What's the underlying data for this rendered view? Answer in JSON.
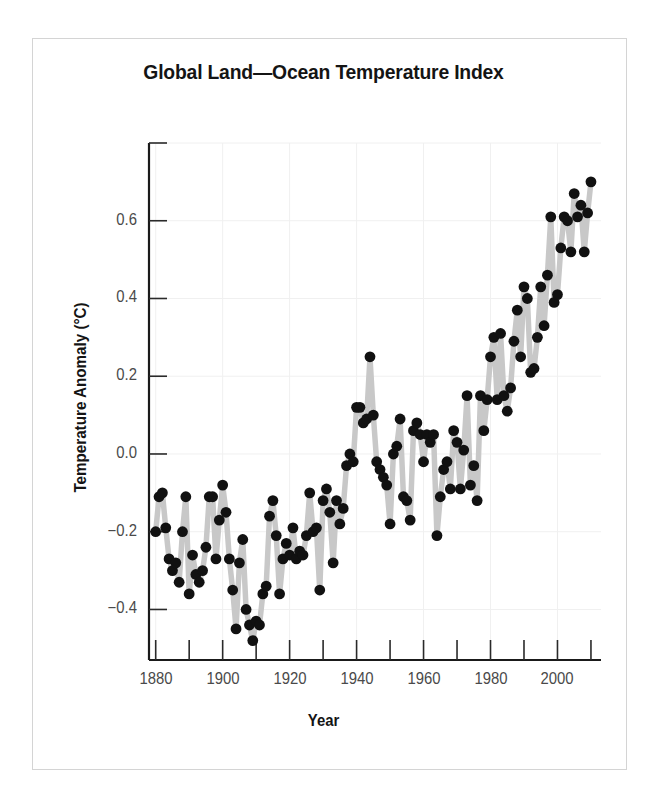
{
  "chart_data": {
    "type": "line",
    "title": "Global Land—Ocean Temperature Index",
    "xlabel": "Year",
    "ylabel": "Temperature Anomaly (°C)",
    "xlim": [
      1878,
      2013
    ],
    "ylim": [
      -0.53,
      0.8
    ],
    "grid": true,
    "legend": "none",
    "marker": "filled-circle",
    "marker_color": "#111111",
    "line_color": "#c8c8c8",
    "x_major_ticks": [
      1880,
      1900,
      1920,
      1940,
      1960,
      1980,
      2000
    ],
    "x_major_tick_labels": [
      "1880",
      "1900",
      "1920",
      "1940",
      "1960",
      "1980",
      "2000"
    ],
    "x_minor_ticks": [
      1890,
      1910,
      1930,
      1950,
      1970,
      1990,
      2010
    ],
    "y_major_ticks": [
      -0.4,
      -0.2,
      0.0,
      0.2,
      0.4,
      0.6,
      0.8
    ],
    "y_major_tick_labels": [
      "-0.4",
      "-0.2",
      "0.0",
      "0.2",
      "0.4",
      "0.6",
      ""
    ],
    "x": [
      1880,
      1881,
      1882,
      1883,
      1884,
      1885,
      1886,
      1887,
      1888,
      1889,
      1890,
      1891,
      1892,
      1893,
      1894,
      1895,
      1896,
      1897,
      1898,
      1899,
      1900,
      1901,
      1902,
      1903,
      1904,
      1905,
      1906,
      1907,
      1908,
      1909,
      1910,
      1911,
      1912,
      1913,
      1914,
      1915,
      1916,
      1917,
      1918,
      1919,
      1920,
      1921,
      1922,
      1923,
      1924,
      1925,
      1926,
      1927,
      1928,
      1929,
      1930,
      1931,
      1932,
      1933,
      1934,
      1935,
      1936,
      1937,
      1938,
      1939,
      1940,
      1941,
      1942,
      1943,
      1944,
      1945,
      1946,
      1947,
      1948,
      1949,
      1950,
      1951,
      1952,
      1953,
      1954,
      1955,
      1956,
      1957,
      1958,
      1959,
      1960,
      1961,
      1962,
      1963,
      1964,
      1965,
      1966,
      1967,
      1968,
      1969,
      1970,
      1971,
      1972,
      1973,
      1974,
      1975,
      1976,
      1977,
      1978,
      1979,
      1980,
      1981,
      1982,
      1983,
      1984,
      1985,
      1986,
      1987,
      1988,
      1989,
      1990,
      1991,
      1992,
      1993,
      1994,
      1995,
      1996,
      1997,
      1998,
      1999,
      2000,
      2001,
      2002,
      2003,
      2004,
      2005,
      2006,
      2007,
      2008,
      2009,
      2010
    ],
    "y": [
      -0.2,
      -0.11,
      -0.1,
      -0.19,
      -0.27,
      -0.3,
      -0.28,
      -0.33,
      -0.2,
      -0.11,
      -0.36,
      -0.26,
      -0.31,
      -0.33,
      -0.3,
      -0.24,
      -0.11,
      -0.11,
      -0.27,
      -0.17,
      -0.08,
      -0.15,
      -0.27,
      -0.35,
      -0.45,
      -0.28,
      -0.22,
      -0.4,
      -0.44,
      -0.48,
      -0.43,
      -0.44,
      -0.36,
      -0.34,
      -0.16,
      -0.12,
      -0.21,
      -0.36,
      -0.27,
      -0.23,
      -0.26,
      -0.19,
      -0.27,
      -0.25,
      -0.26,
      -0.21,
      -0.1,
      -0.2,
      -0.19,
      -0.35,
      -0.12,
      -0.09,
      -0.15,
      -0.28,
      -0.12,
      -0.18,
      -0.14,
      -0.03,
      0.0,
      -0.02,
      0.12,
      0.12,
      0.08,
      0.09,
      0.25,
      0.1,
      -0.02,
      -0.04,
      -0.06,
      -0.08,
      -0.18,
      0.0,
      0.02,
      0.09,
      -0.11,
      -0.12,
      -0.17,
      0.06,
      0.08,
      0.05,
      -0.02,
      0.05,
      0.03,
      0.05,
      -0.21,
      -0.11,
      -0.04,
      -0.02,
      -0.09,
      0.06,
      0.03,
      -0.09,
      0.01,
      0.15,
      -0.08,
      -0.03,
      -0.12,
      0.15,
      0.06,
      0.14,
      0.25,
      0.3,
      0.14,
      0.31,
      0.15,
      0.11,
      0.17,
      0.29,
      0.37,
      0.25,
      0.43,
      0.4,
      0.21,
      0.22,
      0.3,
      0.43,
      0.33,
      0.46,
      0.61,
      0.39,
      0.41,
      0.53,
      0.61,
      0.6,
      0.52,
      0.67,
      0.61,
      0.64,
      0.52,
      0.62,
      0.7
    ]
  },
  "axis_geometry": {
    "plot_left": 149,
    "plot_right": 601,
    "plot_top": 143,
    "plot_bottom": 660
  }
}
